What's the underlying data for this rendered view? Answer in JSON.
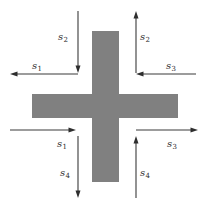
{
  "figure": {
    "background_color": "#ffffff",
    "shape": {
      "name": "plus-cross",
      "fill_color": "#808080",
      "horizontal_bar": {
        "x": 32,
        "y": 94,
        "width": 146,
        "height": 24
      },
      "vertical_bar": {
        "x": 92,
        "y": 31,
        "width": 27,
        "height": 151
      }
    },
    "arrow_color": "#3a3a3a",
    "arrows": [
      {
        "id": "top-left-down",
        "label_base": "s",
        "label_sub": "2",
        "direction": "down",
        "x1": 78,
        "y1": 11,
        "x2": 78,
        "y2": 73
      },
      {
        "id": "top-right-up",
        "label_base": "s",
        "label_sub": "2",
        "direction": "up",
        "x1": 136,
        "y1": 73,
        "x2": 136,
        "y2": 11
      },
      {
        "id": "upper-left-horizontal",
        "label_base": "s",
        "label_sub": "1",
        "direction": "left",
        "x1": 78,
        "y1": 74,
        "x2": 10,
        "y2": 74
      },
      {
        "id": "upper-right-horizontal",
        "label_base": "s",
        "label_sub": "3",
        "direction": "left",
        "x1": 196,
        "y1": 74,
        "x2": 136,
        "y2": 74
      },
      {
        "id": "lower-left-horizontal",
        "label_base": "s",
        "label_sub": "1",
        "direction": "right",
        "x1": 10,
        "y1": 130,
        "x2": 76,
        "y2": 130
      },
      {
        "id": "lower-right-horizontal",
        "label_base": "s",
        "label_sub": "3",
        "direction": "right",
        "x1": 136,
        "y1": 130,
        "x2": 198,
        "y2": 130
      },
      {
        "id": "bottom-left-down",
        "label_base": "s",
        "label_sub": "4",
        "direction": "down",
        "x1": 78,
        "y1": 136,
        "x2": 78,
        "y2": 198
      },
      {
        "id": "bottom-right-up",
        "label_base": "s",
        "label_sub": "4",
        "direction": "up",
        "x1": 136,
        "y1": 198,
        "x2": 136,
        "y2": 136
      }
    ],
    "labels": [
      {
        "id": "label-s2-left",
        "base": "s",
        "sub": "2",
        "x": 58,
        "y": 32
      },
      {
        "id": "label-s2-right",
        "base": "s",
        "sub": "2",
        "x": 140,
        "y": 32
      },
      {
        "id": "label-s1-upper",
        "base": "s",
        "sub": "1",
        "x": 32,
        "y": 61
      },
      {
        "id": "label-s3-upper",
        "base": "s",
        "sub": "3",
        "x": 166,
        "y": 61
      },
      {
        "id": "label-s1-lower",
        "base": "s",
        "sub": "1",
        "x": 57,
        "y": 139
      },
      {
        "id": "label-s3-lower",
        "base": "s",
        "sub": "3",
        "x": 167,
        "y": 139
      },
      {
        "id": "label-s4-left",
        "base": "s",
        "sub": "4",
        "x": 60,
        "y": 168
      },
      {
        "id": "label-s4-right",
        "base": "s",
        "sub": "4",
        "x": 140,
        "y": 168
      }
    ]
  }
}
